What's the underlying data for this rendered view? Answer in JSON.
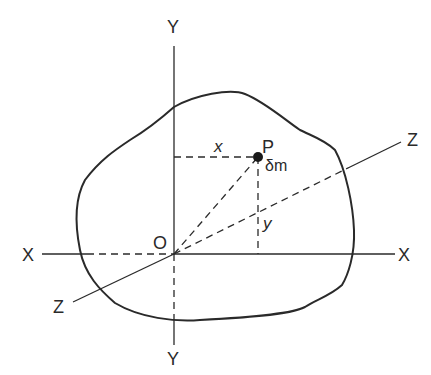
{
  "diagram": {
    "labels": {
      "y_top": "Y",
      "y_bottom": "Y",
      "x_left": "X",
      "x_right": "X",
      "z_left": "Z",
      "z_right": "Z",
      "origin": "O",
      "point": "P",
      "mass": "δm",
      "x_distance": "x",
      "y_distance": "y"
    },
    "colors": {
      "stroke": "#2a2a2a",
      "background": "#ffffff"
    }
  }
}
